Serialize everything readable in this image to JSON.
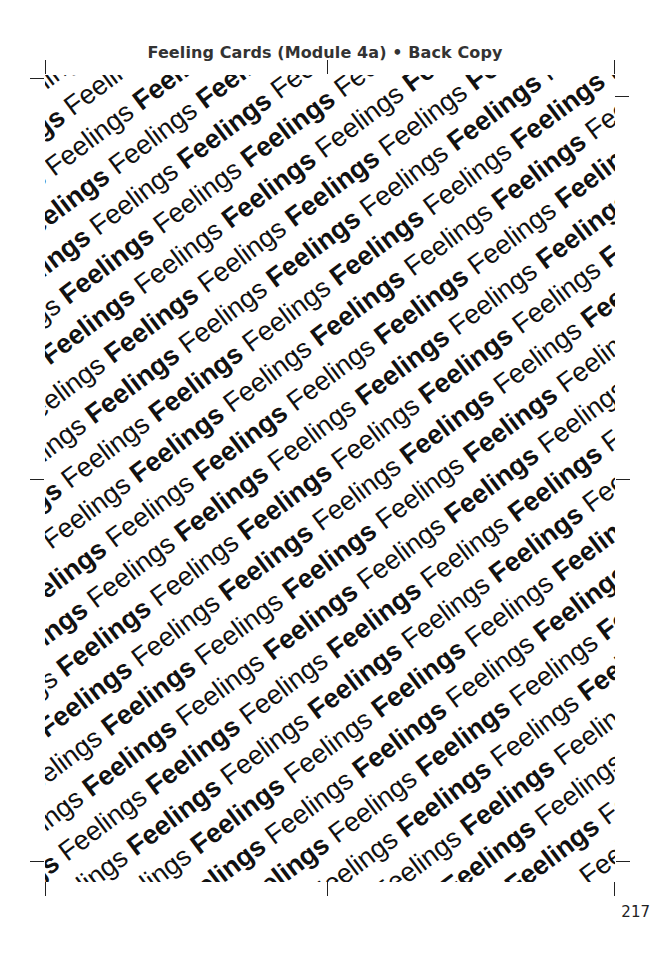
{
  "header": {
    "title": "Feeling Cards (Module 4a)  •  Back Copy"
  },
  "card": {
    "pattern_word": "Feelings",
    "pattern_styles": [
      "bold",
      "regular"
    ],
    "text_color": "#111111"
  },
  "footer": {
    "page_number": "217"
  }
}
